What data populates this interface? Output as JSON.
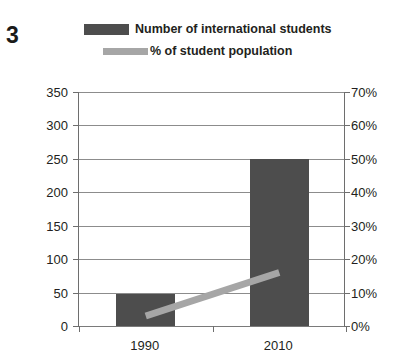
{
  "figure": {
    "number": "3"
  },
  "legend": {
    "position": "top",
    "items": [
      {
        "label": "Number of international students",
        "marker": "bar-swatch-icon",
        "color": "#4d4d4d"
      },
      {
        "label": "% of student population",
        "marker": "line-swatch-icon",
        "color": "#a6a6a6"
      }
    ]
  },
  "chart_data": {
    "type": "bar",
    "title": "",
    "xlabel": "",
    "ylabel": "",
    "categories": [
      "1990",
      "2010"
    ],
    "series": [
      {
        "name": "Number of international students",
        "type": "bar",
        "axis": "left",
        "color": "#4d4d4d",
        "values": [
          48,
          250
        ]
      },
      {
        "name": "% of student population",
        "type": "line",
        "axis": "right",
        "color": "#a6a6a6",
        "values": [
          3,
          16
        ]
      }
    ],
    "axes": {
      "left": {
        "ylim": [
          0,
          350
        ],
        "ticks": [
          0,
          50,
          100,
          150,
          200,
          250,
          300,
          350
        ],
        "tick_labels": [
          "0",
          "50",
          "100",
          "150",
          "200",
          "250",
          "300",
          "350"
        ]
      },
      "right": {
        "ylim": [
          0,
          70
        ],
        "ticks": [
          0,
          10,
          20,
          30,
          40,
          50,
          60,
          70
        ],
        "tick_labels": [
          "0%",
          "10%",
          "20%",
          "30%",
          "40%",
          "50%",
          "60%",
          "70%"
        ]
      },
      "x": {
        "tick_labels": [
          "1990",
          "2010"
        ]
      }
    },
    "grid": true,
    "legend_position": "top"
  }
}
